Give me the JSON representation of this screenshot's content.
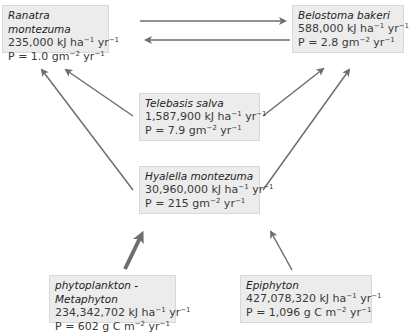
{
  "nodes": {
    "ranatra": {
      "name": "Ranatra montezuma",
      "energy": "235,000 kJ ha",
      "energy_unit_exp": "−1",
      "energy_yr": " yr",
      "energy_yr_exp": "−1",
      "prod": "P = 1.0 gm",
      "prod_exp": "−2",
      "prod_yr": " yr",
      "prod_yr_exp": "−1"
    },
    "belostoma": {
      "name": "Belostoma bakeri",
      "energy": "588,000 kJ ha",
      "energy_unit_exp": "−1",
      "energy_yr": " yr",
      "energy_yr_exp": "−1",
      "prod": "P = 2.8 gm",
      "prod_exp": "−2",
      "prod_yr": " yr",
      "prod_yr_exp": "−1"
    },
    "telebasis": {
      "name": "Telebasis salva",
      "energy": "1,587,900 kJ ha",
      "energy_unit_exp": "−1",
      "energy_yr": " yr",
      "energy_yr_exp": "−1",
      "prod": "P = 7.9 gm",
      "prod_exp": "−2",
      "prod_yr": " yr",
      "prod_yr_exp": "−1"
    },
    "hyalella": {
      "name": "Hyalella montezuma",
      "energy": "30,960,000 kJ ha",
      "energy_unit_exp": "−1",
      "energy_yr": " yr",
      "energy_yr_exp": "−1",
      "prod": "P = 215 gm",
      "prod_exp": "−2",
      "prod_yr": " yr",
      "prod_yr_exp": "−1"
    },
    "phyto": {
      "name": "phytoplankton - Metaphyton",
      "energy": "234,342,702 kJ ha",
      "energy_unit_exp": "−1",
      "energy_yr": " yr",
      "energy_yr_exp": "−1",
      "prod": "P = 602 g C m",
      "prod_exp": "−2",
      "prod_yr": " yr",
      "prod_yr_exp": "−1"
    },
    "epiphyton": {
      "name": "Epiphyton",
      "energy": "427,078,320 kJ ha",
      "energy_unit_exp": "−1",
      "energy_yr": " yr",
      "energy_yr_exp": "−1",
      "prod": "P = 1,096 g C m",
      "prod_exp": "−2",
      "prod_yr": " yr",
      "prod_yr_exp": "−1"
    }
  },
  "edges": [
    {
      "from": "Ranatra montezuma",
      "to": "Belostoma bakeri"
    },
    {
      "from": "Belostoma bakeri",
      "to": "Ranatra montezuma"
    },
    {
      "from": "Telebasis salva",
      "to": "Ranatra montezuma"
    },
    {
      "from": "Telebasis salva",
      "to": "Belostoma bakeri"
    },
    {
      "from": "Hyalella montezuma",
      "to": "Ranatra montezuma"
    },
    {
      "from": "Hyalella montezuma",
      "to": "Belostoma bakeri"
    },
    {
      "from": "phytoplankton - Metaphyton",
      "to": "Hyalella montezuma",
      "weight": "thick"
    },
    {
      "from": "Epiphyton",
      "to": "Hyalella montezuma"
    }
  ],
  "colors": {
    "box": "#ececec",
    "arrow": "#6e6e6e"
  }
}
